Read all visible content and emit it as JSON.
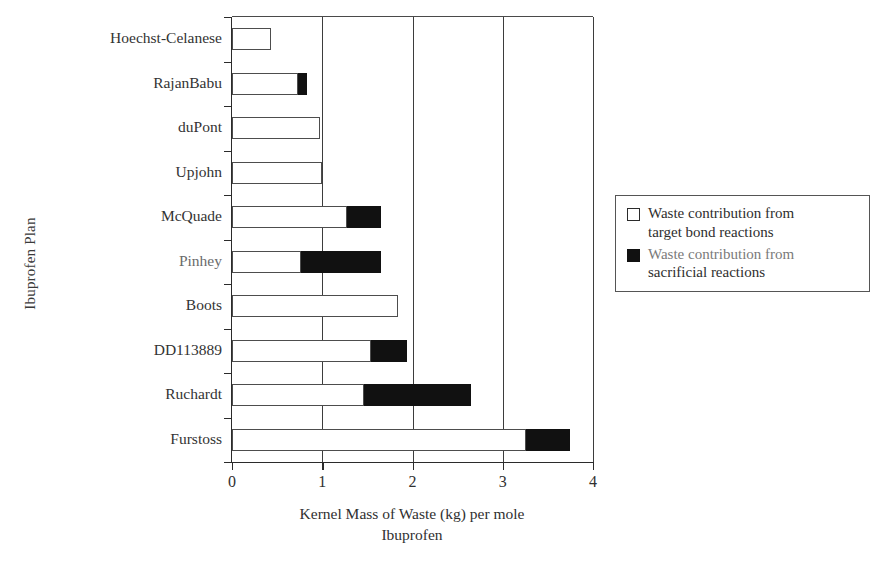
{
  "chart_data": {
    "type": "bar",
    "orientation": "horizontal",
    "stacked": true,
    "title": "",
    "xlabel": "Kernel Mass of Waste (kg) per mole Ibuprofen",
    "ylabel": "Ibuprofen Plan",
    "xlim": [
      0,
      4
    ],
    "xticks": [
      0,
      1,
      2,
      3,
      4
    ],
    "xticklabels": [
      "0",
      "1",
      "2",
      "3",
      "4"
    ],
    "grid": "vertical",
    "legend_position": "right",
    "categories": [
      "Hoechst-Celanese",
      "RajanBabu",
      "duPont",
      "Upjohn",
      "McQuade",
      "Pinhey",
      "Boots",
      "DD113889",
      "Ruchardt",
      "Furstoss"
    ],
    "series": [
      {
        "name": "Waste contribution from target bond reactions",
        "color": "#ffffff",
        "values": [
          0.43,
          0.73,
          0.98,
          1.0,
          1.27,
          0.76,
          1.84,
          1.54,
          1.46,
          3.26
        ]
      },
      {
        "name": "Waste contribution from sacrificial reactions",
        "color": "#111111",
        "values": [
          0.0,
          0.1,
          0.0,
          0.0,
          0.38,
          0.89,
          0.0,
          0.4,
          1.19,
          0.48
        ]
      }
    ],
    "totals": [
      0.43,
      0.83,
      0.98,
      1.0,
      1.65,
      1.65,
      1.84,
      1.94,
      2.65,
      3.74
    ]
  },
  "axes": {
    "y_title": "Ibuprofen Plan",
    "x_title_line1": "Kernel Mass of Waste (kg) per mole",
    "x_title_line2": "Ibuprofen",
    "x_ticklabels": [
      "0",
      "1",
      "2",
      "3",
      "4"
    ],
    "category_labels": [
      "Hoechst-Celanese",
      "RajanBabu",
      "duPont",
      "Upjohn",
      "McQuade",
      "Pinhey",
      "Boots",
      "DD113889",
      "Ruchardt",
      "Furstoss"
    ]
  },
  "legend": {
    "entries": [
      {
        "swatch": "open-square",
        "line1": "Waste contribution from",
        "line2": "target bond reactions"
      },
      {
        "swatch": "filled-square",
        "line1": "Waste contribution from",
        "line2": "sacrificial reactions"
      }
    ]
  },
  "colors": {
    "target_bond": "#ffffff",
    "sacrificial": "#111111",
    "axis": "#2b2b2b",
    "grid": "#3d3d3d"
  }
}
